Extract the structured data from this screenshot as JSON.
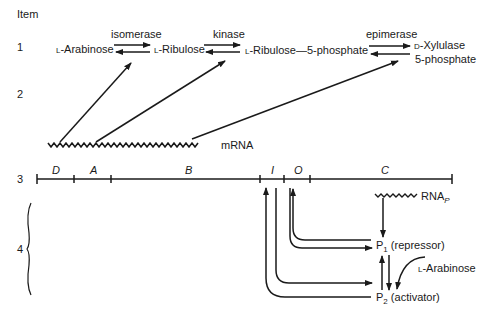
{
  "header": {
    "column_label": "Item"
  },
  "items": [
    {
      "number": "1"
    },
    {
      "number": "2"
    },
    {
      "number": "3"
    },
    {
      "number": "4"
    }
  ],
  "pathway": {
    "substrates": [
      {
        "prefix": "L",
        "name": "-Arabinose"
      },
      {
        "prefix": "L",
        "name": "-Ribulose"
      },
      {
        "prefix": "L",
        "name": "-Ribulose—5-phosphate"
      },
      {
        "prefix": "D",
        "name": "-Xylulase",
        "line2": "5-phosphate"
      }
    ],
    "enzymes": [
      "isomerase",
      "kinase",
      "epimerase"
    ]
  },
  "mrna": {
    "label": "mRNA"
  },
  "operon": {
    "genes": [
      "D",
      "A",
      "B",
      "I",
      "O",
      "C"
    ]
  },
  "regulation": {
    "rna_label": "RNA",
    "rna_subscript": "P",
    "p1_label": "P",
    "p1_subscript": "1",
    "p1_role": "(repressor)",
    "p2_label": "P",
    "p2_subscript": "2",
    "p2_role": "(activator)",
    "inducer": {
      "prefix": "L",
      "name": "-Arabinose"
    }
  }
}
